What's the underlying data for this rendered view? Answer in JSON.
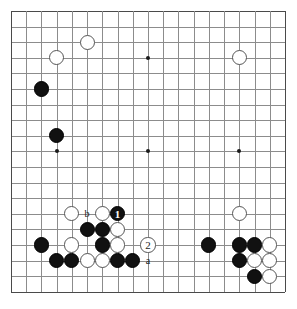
{
  "diagram": {
    "board": {
      "size": 19,
      "cols": 19,
      "rows": 19,
      "grid_color": "#8c8c8c",
      "border_color": "#4a4a4a",
      "background_color": "#ffffff",
      "origin_x": 11,
      "origin_y": 11,
      "step_x": 15.22,
      "step_y": 15.6
    },
    "star_points": [
      {
        "col": 3,
        "row": 3
      },
      {
        "col": 9,
        "row": 3
      },
      {
        "col": 15,
        "row": 3
      },
      {
        "col": 3,
        "row": 9
      },
      {
        "col": 9,
        "row": 9
      },
      {
        "col": 15,
        "row": 9
      }
    ],
    "stones": [
      {
        "color": "white",
        "col": 5,
        "row": 2,
        "label": ""
      },
      {
        "color": "white",
        "col": 3,
        "row": 3,
        "label": ""
      },
      {
        "color": "white",
        "col": 15,
        "row": 3,
        "label": ""
      },
      {
        "color": "black",
        "col": 2,
        "row": 5,
        "label": ""
      },
      {
        "color": "black",
        "col": 3,
        "row": 8,
        "label": ""
      },
      {
        "color": "white",
        "col": 4,
        "row": 13,
        "label": ""
      },
      {
        "color": "white",
        "col": 6,
        "row": 13,
        "label": ""
      },
      {
        "color": "black",
        "col": 7,
        "row": 13,
        "label": "1"
      },
      {
        "color": "white",
        "col": 15,
        "row": 13,
        "label": ""
      },
      {
        "color": "black",
        "col": 5,
        "row": 14,
        "label": ""
      },
      {
        "color": "black",
        "col": 6,
        "row": 14,
        "label": ""
      },
      {
        "color": "white",
        "col": 7,
        "row": 14,
        "label": ""
      },
      {
        "color": "black",
        "col": 2,
        "row": 15,
        "label": ""
      },
      {
        "color": "white",
        "col": 4,
        "row": 15,
        "label": ""
      },
      {
        "color": "black",
        "col": 6,
        "row": 15,
        "label": ""
      },
      {
        "color": "white",
        "col": 7,
        "row": 15,
        "label": ""
      },
      {
        "color": "white",
        "col": 9,
        "row": 15,
        "label": "2"
      },
      {
        "color": "black",
        "col": 13,
        "row": 15,
        "label": ""
      },
      {
        "color": "black",
        "col": 15,
        "row": 15,
        "label": ""
      },
      {
        "color": "black",
        "col": 16,
        "row": 15,
        "label": ""
      },
      {
        "color": "white",
        "col": 17,
        "row": 15,
        "label": ""
      },
      {
        "color": "black",
        "col": 3,
        "row": 16,
        "label": ""
      },
      {
        "color": "black",
        "col": 4,
        "row": 16,
        "label": ""
      },
      {
        "color": "white",
        "col": 5,
        "row": 16,
        "label": ""
      },
      {
        "color": "white",
        "col": 6,
        "row": 16,
        "label": ""
      },
      {
        "color": "black",
        "col": 7,
        "row": 16,
        "label": ""
      },
      {
        "color": "black",
        "col": 8,
        "row": 16,
        "label": ""
      },
      {
        "color": "black",
        "col": 15,
        "row": 16,
        "label": ""
      },
      {
        "color": "white",
        "col": 16,
        "row": 16,
        "label": ""
      },
      {
        "color": "white",
        "col": 17,
        "row": 16,
        "label": ""
      },
      {
        "color": "black",
        "col": 16,
        "row": 17,
        "label": ""
      },
      {
        "color": "white",
        "col": 17,
        "row": 17,
        "label": ""
      }
    ],
    "point_labels": [
      {
        "text": "b",
        "col": 5,
        "row": 13
      },
      {
        "text": "a",
        "col": 9,
        "row": 16
      }
    ]
  }
}
